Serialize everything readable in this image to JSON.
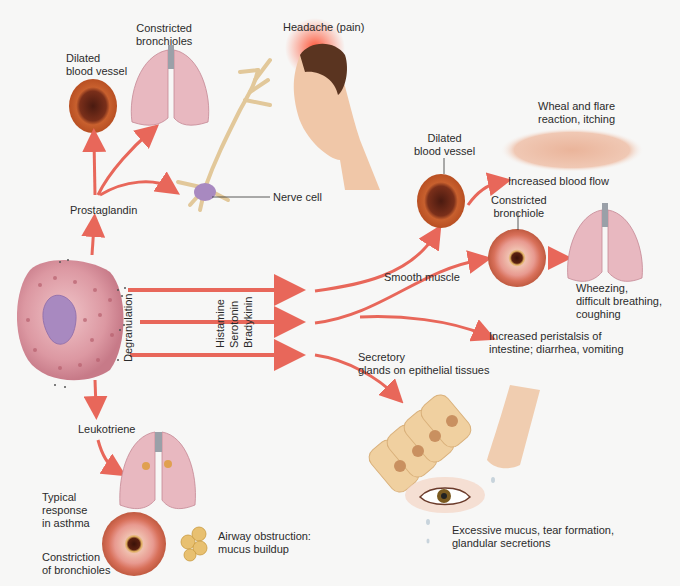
{
  "diagram": {
    "colors": {
      "arrow": "#e8675a",
      "background": "#f7f7f6",
      "vessel": "#c8602e",
      "lung": "#e8b4bc",
      "mast_cell": "#d98a96",
      "nucleus": "#a889c0"
    },
    "top_left": {
      "prostaglandin": "Prostaglandin",
      "dilated_vessel": [
        "Dilated",
        "blood vessel"
      ],
      "constricted_bronchioles": [
        "Constricted",
        "bronchioles"
      ],
      "headache": "Headache (pain)",
      "nerve_cell": "Nerve cell"
    },
    "center": {
      "degranulation": "Degranulation",
      "mediators": [
        "Histamine",
        "Serotonin",
        "Bradykinin"
      ]
    },
    "right": {
      "dilated_vessel": [
        "Dilated",
        "blood vessel"
      ],
      "wheal": [
        "Wheal and flare",
        "reaction, itching"
      ],
      "blood_flow": "Increased blood flow",
      "constricted_bronchiole": [
        "Constricted",
        "bronchiole"
      ],
      "smooth_muscle": "Smooth muscle",
      "wheezing": [
        "Wheezing,",
        "difficult breathing,",
        "coughing"
      ],
      "peristalsis": [
        "Increased peristalsis of",
        "intestine; diarrhea, vomiting"
      ],
      "secretory": [
        "Secretory",
        "glands on epithelial tissues"
      ],
      "mucus": [
        "Excessive mucus, tear formation,",
        "glandular secretions"
      ]
    },
    "bottom_left": {
      "leukotriene": "Leukotriene",
      "asthma": [
        "Typical",
        "response",
        "in asthma"
      ],
      "airway": [
        "Airway obstruction:",
        "mucus buildup"
      ],
      "constriction": [
        "Constriction",
        "of bronchioles"
      ]
    }
  }
}
